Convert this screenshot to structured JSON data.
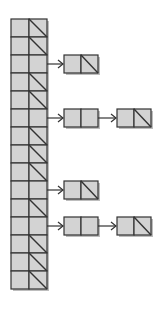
{
  "diagram": {
    "type": "hash-table-with-chaining",
    "colors": {
      "cell_fill": "#d3d3d3",
      "border": "#333333",
      "shadow": "#bdbdbd",
      "background": "#ffffff"
    },
    "table": {
      "x": 11,
      "y": 19,
      "cell_width": 18,
      "row_height": 18,
      "slot_count": 15
    },
    "node": {
      "cell_width": 17,
      "height": 18,
      "first_x": 64,
      "spacing": 53
    },
    "slots": [
      {
        "index": 0,
        "chain_length": 0
      },
      {
        "index": 1,
        "chain_length": 0
      },
      {
        "index": 2,
        "chain_length": 1
      },
      {
        "index": 3,
        "chain_length": 0
      },
      {
        "index": 4,
        "chain_length": 0
      },
      {
        "index": 5,
        "chain_length": 2
      },
      {
        "index": 6,
        "chain_length": 0
      },
      {
        "index": 7,
        "chain_length": 0
      },
      {
        "index": 8,
        "chain_length": 0
      },
      {
        "index": 9,
        "chain_length": 1
      },
      {
        "index": 10,
        "chain_length": 0
      },
      {
        "index": 11,
        "chain_length": 2
      },
      {
        "index": 12,
        "chain_length": 0
      },
      {
        "index": 13,
        "chain_length": 0
      },
      {
        "index": 14,
        "chain_length": 0
      }
    ]
  }
}
